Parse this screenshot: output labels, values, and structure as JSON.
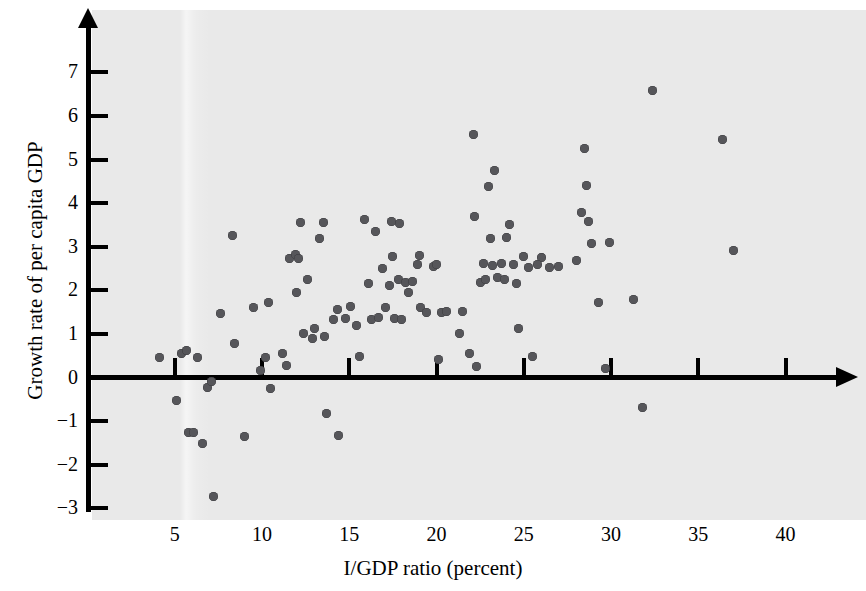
{
  "chart_data": {
    "type": "scatter",
    "title": "",
    "xlabel": "I/GDP ratio (percent)",
    "ylabel": "Growth rate of per capita GDP",
    "xlim": [
      0,
      42
    ],
    "ylim": [
      -3,
      7.6
    ],
    "xticks": [
      5,
      10,
      15,
      20,
      25,
      30,
      35,
      40
    ],
    "yticks": [
      7,
      6,
      5,
      4,
      3,
      2,
      1,
      0,
      -1,
      -2,
      -3
    ],
    "xtick_labels": [
      "5",
      "10",
      "15",
      "20",
      "25",
      "30",
      "35",
      "40"
    ],
    "ytick_labels": [
      "7",
      "6",
      "5",
      "4",
      "3",
      "2",
      "1",
      "0",
      "-1",
      "-2",
      "-3"
    ],
    "grid": false,
    "legend": null,
    "marker_color": "#56565a",
    "plot_background": "#e9e9e9",
    "axis_color": "#000000",
    "points": [
      [
        4.1,
        0.45
      ],
      [
        5.1,
        -0.52
      ],
      [
        5.4,
        0.55
      ],
      [
        5.7,
        0.62
      ],
      [
        5.8,
        -1.25
      ],
      [
        6.1,
        -1.27
      ],
      [
        6.3,
        0.45
      ],
      [
        6.6,
        -1.52
      ],
      [
        6.9,
        -0.22
      ],
      [
        7.1,
        -0.09
      ],
      [
        7.2,
        -2.72
      ],
      [
        7.6,
        1.47
      ],
      [
        8.3,
        3.26
      ],
      [
        8.4,
        0.78
      ],
      [
        9.0,
        -1.35
      ],
      [
        9.5,
        1.61
      ],
      [
        9.9,
        0.15
      ],
      [
        10.2,
        0.45
      ],
      [
        10.4,
        1.73
      ],
      [
        10.5,
        -0.25
      ],
      [
        11.2,
        0.55
      ],
      [
        11.4,
        0.28
      ],
      [
        11.6,
        2.72
      ],
      [
        11.9,
        2.83
      ],
      [
        12.0,
        1.95
      ],
      [
        12.1,
        2.74
      ],
      [
        12.2,
        3.56
      ],
      [
        12.6,
        2.25
      ],
      [
        12.9,
        0.9
      ],
      [
        13.0,
        1.12
      ],
      [
        13.3,
        3.18
      ],
      [
        13.5,
        3.55
      ],
      [
        13.6,
        0.95
      ],
      [
        13.7,
        -0.82
      ],
      [
        14.1,
        1.33
      ],
      [
        14.3,
        1.55
      ],
      [
        14.4,
        -1.33
      ],
      [
        15.1,
        1.63
      ],
      [
        15.4,
        1.2
      ],
      [
        15.6,
        0.48
      ],
      [
        15.9,
        3.62
      ],
      [
        16.1,
        2.15
      ],
      [
        16.3,
        1.32
      ],
      [
        16.5,
        3.35
      ],
      [
        16.7,
        1.37
      ],
      [
        16.9,
        2.5
      ],
      [
        17.1,
        1.6
      ],
      [
        17.3,
        2.1
      ],
      [
        17.4,
        3.58
      ],
      [
        17.5,
        2.78
      ],
      [
        17.6,
        1.36
      ],
      [
        17.8,
        2.25
      ],
      [
        17.9,
        3.54
      ],
      [
        18.2,
        2.18
      ],
      [
        18.4,
        1.95
      ],
      [
        18.6,
        2.2
      ],
      [
        18.9,
        2.6
      ],
      [
        19.1,
        1.6
      ],
      [
        19.4,
        1.5
      ],
      [
        19.8,
        2.55
      ],
      [
        20.1,
        0.42
      ],
      [
        20.3,
        1.5
      ],
      [
        20.6,
        1.52
      ],
      [
        21.3,
        1.0
      ],
      [
        21.9,
        0.55
      ],
      [
        22.1,
        5.58
      ],
      [
        22.2,
        3.7
      ],
      [
        22.3,
        0.25
      ],
      [
        22.5,
        2.18
      ],
      [
        22.7,
        2.62
      ],
      [
        23.0,
        4.38
      ],
      [
        23.1,
        3.18
      ],
      [
        23.2,
        2.58
      ],
      [
        23.3,
        4.75
      ],
      [
        23.5,
        2.3
      ],
      [
        23.7,
        2.62
      ],
      [
        24.0,
        3.22
      ],
      [
        24.2,
        3.52
      ],
      [
        24.4,
        2.6
      ],
      [
        24.6,
        2.15
      ],
      [
        24.7,
        1.12
      ],
      [
        25.0,
        2.78
      ],
      [
        25.3,
        2.52
      ],
      [
        25.5,
        0.48
      ],
      [
        26.0,
        2.75
      ],
      [
        26.5,
        2.52
      ],
      [
        28.0,
        2.68
      ],
      [
        28.3,
        3.78
      ],
      [
        28.5,
        5.25
      ],
      [
        28.6,
        4.4
      ],
      [
        28.7,
        3.58
      ],
      [
        28.9,
        3.08
      ],
      [
        29.3,
        1.72
      ],
      [
        29.7,
        0.2
      ],
      [
        29.9,
        3.1
      ],
      [
        31.3,
        1.78
      ],
      [
        31.8,
        -0.68
      ],
      [
        32.4,
        6.58
      ],
      [
        36.4,
        5.45
      ],
      [
        37.0,
        2.92
      ],
      [
        22.8,
        2.25
      ],
      [
        20.0,
        2.6
      ],
      [
        12.4,
        1.0
      ],
      [
        14.8,
        1.35
      ],
      [
        18.0,
        1.32
      ],
      [
        19.0,
        2.8
      ],
      [
        23.9,
        2.25
      ],
      [
        21.5,
        1.52
      ],
      [
        25.8,
        2.6
      ],
      [
        27.0,
        2.55
      ]
    ]
  }
}
